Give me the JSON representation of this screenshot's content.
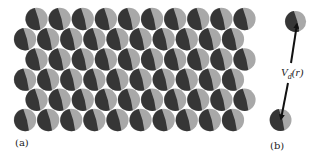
{
  "figure": {
    "colors": {
      "background": "#ffffff",
      "dark_half": "#363636",
      "light_half": "#a8a8a8",
      "arrow": "#111111",
      "text": "#222222"
    },
    "panel_a": {
      "label": "(a)",
      "label_pos": [
        15,
        146
      ],
      "lattice": {
        "rows": 6,
        "cols": 10,
        "radius": 11.2,
        "dx": 23.1,
        "dy": 20.2,
        "first_row_center_y": 19,
        "odd_row_start_x": 36.5,
        "even_row_start_x": 25.0
      }
    },
    "panel_b": {
      "label": "(b)",
      "label_pos": [
        270,
        149
      ],
      "top_particle": {
        "cx": 295.5,
        "cy": 21.5,
        "r": 10.6
      },
      "bottom_particle": {
        "cx": 280.5,
        "cy": 120,
        "r": 11
      },
      "potential_label": {
        "main": "V",
        "sub": "d",
        "arg": "(r)",
        "pos": [
          281,
          76
        ]
      },
      "arrow_up": {
        "from": [
          291,
          63
        ],
        "to": [
          297,
          24
        ]
      },
      "arrow_down": {
        "from": [
          288,
          83
        ],
        "to": [
          281,
          119
        ]
      }
    }
  }
}
